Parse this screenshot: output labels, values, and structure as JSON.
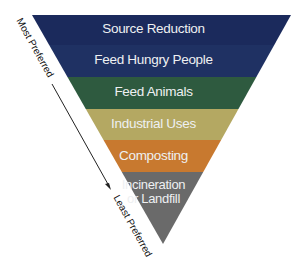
{
  "diagram": {
    "type": "inverted-pyramid",
    "tiers": [
      {
        "label": "Source Reduction",
        "color": "#1b2a5c"
      },
      {
        "label": "Feed Hungry People",
        "color": "#1f3163"
      },
      {
        "label": "Feed Animals",
        "color": "#2e5a3f"
      },
      {
        "label": "Industrial Uses",
        "color": "#b4a862"
      },
      {
        "label": "Composting",
        "color": "#c8792f"
      },
      {
        "label_line1": "Incineration",
        "label_line2": "or Landfill",
        "color": "#6a6a6a"
      }
    ],
    "axis": {
      "top_label": "Most Preferred",
      "bottom_label": "Least Preferred"
    }
  }
}
